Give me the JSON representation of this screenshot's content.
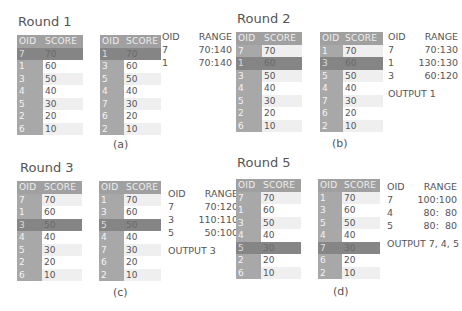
{
  "header_labels": {
    "oid": "OID",
    "score": "SCORE",
    "range": "RANGE",
    "output_prefix": "OUTPUT"
  },
  "panels": [
    {
      "id": "a",
      "title": "Round 1",
      "caption": "(a)",
      "left_table": {
        "rows": [
          [
            "7",
            "70"
          ],
          [
            "1",
            "60"
          ],
          [
            "3",
            "50"
          ],
          [
            "4",
            "40"
          ],
          [
            "5",
            "30"
          ],
          [
            "2",
            "20"
          ],
          [
            "6",
            "10"
          ]
        ],
        "highlight_row": 0
      },
      "right_table": {
        "rows": [
          [
            "1",
            "70"
          ],
          [
            "3",
            "60"
          ],
          [
            "5",
            "50"
          ],
          [
            "4",
            "40"
          ],
          [
            "7",
            "30"
          ],
          [
            "6",
            "20"
          ],
          [
            "2",
            "10"
          ]
        ],
        "highlight_row": 0
      },
      "ranges": [
        {
          "oid": "7",
          "range": "70:140"
        },
        {
          "oid": "1",
          "range": "70:140"
        }
      ],
      "output": ""
    },
    {
      "id": "b",
      "title": "Round 2",
      "caption": "(b)",
      "left_table": {
        "rows": [
          [
            "7",
            "70"
          ],
          [
            "1",
            "60"
          ],
          [
            "3",
            "50"
          ],
          [
            "4",
            "40"
          ],
          [
            "5",
            "30"
          ],
          [
            "2",
            "20"
          ],
          [
            "6",
            "10"
          ]
        ],
        "highlight_row": 1
      },
      "right_table": {
        "rows": [
          [
            "1",
            "70"
          ],
          [
            "3",
            "60"
          ],
          [
            "5",
            "50"
          ],
          [
            "4",
            "40"
          ],
          [
            "7",
            "30"
          ],
          [
            "6",
            "20"
          ],
          [
            "2",
            "10"
          ]
        ],
        "highlight_row": 1
      },
      "ranges": [
        {
          "oid": "7",
          "range": "70:130"
        },
        {
          "oid": "1",
          "range": "130:130"
        },
        {
          "oid": "3",
          "range": "60:120"
        }
      ],
      "output": "OUTPUT  1"
    },
    {
      "id": "c",
      "title": "Round 3",
      "caption": "(c)",
      "left_table": {
        "rows": [
          [
            "7",
            "70"
          ],
          [
            "1",
            "60"
          ],
          [
            "3",
            "50"
          ],
          [
            "4",
            "40"
          ],
          [
            "5",
            "30"
          ],
          [
            "2",
            "20"
          ],
          [
            "6",
            "10"
          ]
        ],
        "highlight_row": 2
      },
      "right_table": {
        "rows": [
          [
            "1",
            "70"
          ],
          [
            "3",
            "60"
          ],
          [
            "5",
            "50"
          ],
          [
            "4",
            "40"
          ],
          [
            "7",
            "30"
          ],
          [
            "6",
            "20"
          ],
          [
            "2",
            "10"
          ]
        ],
        "highlight_row": 2
      },
      "ranges": [
        {
          "oid": "7",
          "range": "70:120"
        },
        {
          "oid": "3",
          "range": "110:110"
        },
        {
          "oid": "5",
          "range": "50:100"
        }
      ],
      "output": "OUTPUT  3"
    },
    {
      "id": "d",
      "title": "Round 5",
      "caption": "(d)",
      "left_table": {
        "rows": [
          [
            "7",
            "70"
          ],
          [
            "1",
            "60"
          ],
          [
            "3",
            "50"
          ],
          [
            "4",
            "40"
          ],
          [
            "5",
            "30"
          ],
          [
            "2",
            "20"
          ],
          [
            "6",
            "10"
          ]
        ],
        "highlight_row": 4
      },
      "right_table": {
        "rows": [
          [
            "1",
            "70"
          ],
          [
            "3",
            "60"
          ],
          [
            "5",
            "50"
          ],
          [
            "4",
            "40"
          ],
          [
            "7",
            "30"
          ],
          [
            "6",
            "20"
          ],
          [
            "2",
            "10"
          ]
        ],
        "highlight_row": 4
      },
      "ranges": [
        {
          "oid": "7",
          "range": "100:100"
        },
        {
          "oid": "4",
          "range": "80:  80"
        },
        {
          "oid": "5",
          "range": "80:  80"
        }
      ],
      "output": "OUTPUT 7, 4, 5"
    }
  ],
  "colors": {
    "header": "#a0a0a0",
    "oid_column": "#a8a8a8",
    "highlight": "#858585",
    "stripe": "#efefef"
  }
}
